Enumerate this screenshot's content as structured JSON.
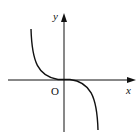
{
  "diagram": {
    "type": "function-graph",
    "curve": "decreasing cubic-like curve through origin (y = -x^3 shape)",
    "labels": {
      "x_axis": "x",
      "y_axis": "y",
      "origin": "O"
    },
    "colors": {
      "stroke": "#111111",
      "background": "#ffffff"
    }
  }
}
